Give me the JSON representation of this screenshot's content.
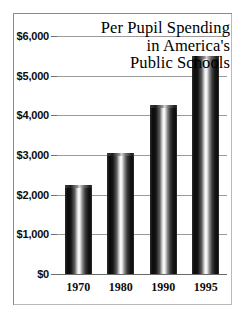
{
  "chart_data": {
    "type": "bar",
    "title": "Per Pupil Spending in America's Public Schools",
    "title_lines": [
      "Per Pupil Spending",
      "in America's",
      "Public Schools"
    ],
    "categories": [
      "1970",
      "1980",
      "1990",
      "1995"
    ],
    "values": [
      2250,
      3050,
      4250,
      5500
    ],
    "xlabel": "",
    "ylabel": "",
    "ylim": [
      0,
      6000
    ],
    "ytick_values": [
      0,
      1000,
      2000,
      3000,
      4000,
      5000,
      6000
    ],
    "ytick_labels": [
      "$0",
      "$1,000",
      "$2,000",
      "$3,000",
      "$4,000",
      "$5,000",
      "$6,000"
    ],
    "grid": true,
    "legend": false,
    "bar_style": "cylindrical-gradient",
    "colors": {
      "background": "#ffffff",
      "frame": "#8a8a8a",
      "gridline": "#9a9a9a",
      "text": "#0c0c0c",
      "bar_dark": "#0d0d0d",
      "bar_highlight": "#ffffff"
    }
  }
}
